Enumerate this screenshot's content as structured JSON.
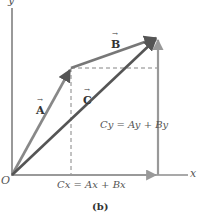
{
  "figure": {
    "caption": "(b)",
    "axes": {
      "x_label": "x",
      "y_label": "y",
      "origin_label": "O"
    },
    "vectors": [
      {
        "name": "A",
        "label": "A",
        "from": [
          12,
          175
        ],
        "to": [
          71,
          68
        ],
        "color": "#777777"
      },
      {
        "name": "B",
        "label": "B",
        "from": [
          71,
          68
        ],
        "to": [
          158,
          37
        ],
        "color": "#666666"
      },
      {
        "name": "C",
        "label": "C",
        "from": [
          12,
          175
        ],
        "to": [
          158,
          37
        ],
        "color": "#555555"
      }
    ],
    "components": {
      "cx_label": "Cx = Ax + Bx",
      "cy_label": "Cy = Ay + By"
    },
    "colors": {
      "axis": "#555555",
      "vector": "#666666",
      "component": "#999999",
      "dashed": "#777777"
    }
  }
}
